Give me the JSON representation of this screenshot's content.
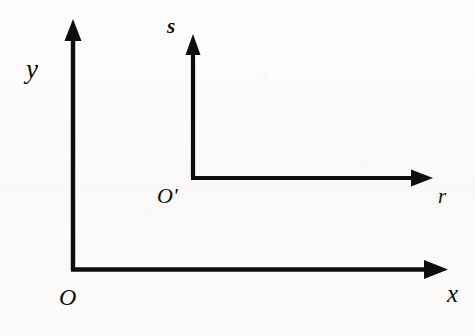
{
  "figure": {
    "type": "line-diagram",
    "background_color": "#fbfaf8",
    "stroke_color": "#0d0d0d",
    "stroke_width_px": 4
  },
  "frames": [
    {
      "id": "global-frame",
      "origin_label": "O",
      "origin_point": {
        "x": 73,
        "y": 270
      },
      "axes": [
        {
          "id": "y-axis",
          "label": "y",
          "direction": "up",
          "from": {
            "x": 73,
            "y": 270
          },
          "to": {
            "x": 73,
            "y": 20
          },
          "length_px": 250,
          "arrowhead": true,
          "label_position": {
            "x": 33,
            "y": 68
          }
        },
        {
          "id": "x-axis",
          "label": "x",
          "direction": "right",
          "from": {
            "x": 73,
            "y": 269
          },
          "to": {
            "x": 447,
            "y": 269
          },
          "length_px": 374,
          "arrowhead": true,
          "label_position": {
            "x": 453,
            "y": 292
          }
        }
      ],
      "origin_label_position": {
        "x": 65,
        "y": 297
      }
    },
    {
      "id": "local-frame",
      "origin_label": "O'",
      "origin_point": {
        "x": 193,
        "y": 178
      },
      "axes": [
        {
          "id": "s-axis",
          "label": "s",
          "direction": "up",
          "from": {
            "x": 193,
            "y": 178
          },
          "to": {
            "x": 193,
            "y": 35
          },
          "length_px": 143,
          "arrowhead": true,
          "label_position": {
            "x": 176,
            "y": 27
          }
        },
        {
          "id": "r-axis",
          "label": "r",
          "direction": "right",
          "from": {
            "x": 193,
            "y": 178
          },
          "to": {
            "x": 432,
            "y": 178
          },
          "length_px": 239,
          "arrowhead": true,
          "label_position": {
            "x": 445,
            "y": 196
          }
        }
      ],
      "origin_label_position": {
        "x": 168,
        "y": 196
      }
    }
  ],
  "labels": {
    "y": "y",
    "x": "x",
    "origin": "O",
    "s": "s",
    "r": "r",
    "origin_prime": "O'"
  }
}
